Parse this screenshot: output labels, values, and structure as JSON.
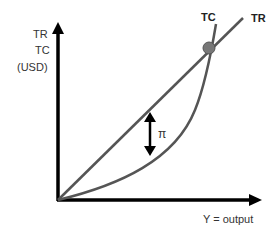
{
  "diagram": {
    "title": "",
    "y_axis_label": [
      "TR",
      "TC",
      "(USD)"
    ],
    "x_axis_label": "Y = output",
    "curves": [
      {
        "name": "TR",
        "label": "TR",
        "shape": "straight line from origin"
      },
      {
        "name": "TC",
        "label": "TC",
        "shape": "convex curve from origin"
      }
    ],
    "profit_symbol": "π",
    "intersection_marker": "break-even point",
    "colors": {
      "axis": "#000000",
      "curve": "#555555",
      "marker": "#777777",
      "text": "#333333"
    }
  }
}
